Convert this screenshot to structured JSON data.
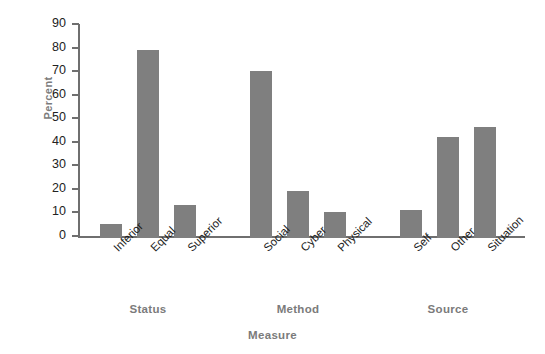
{
  "chart_data": {
    "type": "bar",
    "title": "",
    "xlabel": "Measure",
    "ylabel": "Percent",
    "ylim": [
      0,
      90
    ],
    "yticks": [
      0,
      10,
      20,
      30,
      40,
      50,
      60,
      70,
      80,
      90
    ],
    "grid": false,
    "legend": null,
    "bar_color": "#7f7f7f",
    "axis_color": "#6f6f6f",
    "label_color": "#7b7b7b",
    "categories": [
      "Inferior",
      "Equal",
      "Superior",
      "Social",
      "Cyber",
      "Physical",
      "Self",
      "Other",
      "Situation"
    ],
    "values": [
      6,
      80,
      14,
      71,
      20,
      11,
      12,
      43,
      47
    ],
    "groups": [
      {
        "label": "Status",
        "categories": [
          "Inferior",
          "Equal",
          "Superior"
        ],
        "values": [
          6,
          80,
          14
        ]
      },
      {
        "label": "Method",
        "categories": [
          "Social",
          "Cyber",
          "Physical"
        ],
        "values": [
          71,
          20,
          11
        ]
      },
      {
        "label": "Source",
        "categories": [
          "Self",
          "Other",
          "Situation"
        ],
        "values": [
          12,
          43,
          47
        ]
      }
    ]
  }
}
